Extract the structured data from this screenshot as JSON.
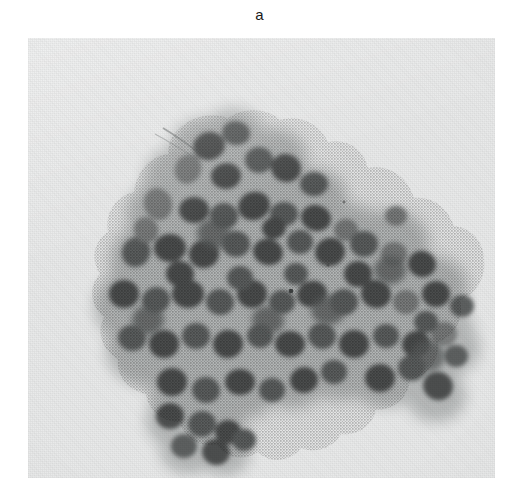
{
  "figure": {
    "panel_label": "a",
    "kind": "light-microscopy-photomicrograph",
    "background_color": "#e9eaea",
    "page_color": "#ffffff",
    "nucleus_color": "#5d6060",
    "nucleus_dark_color": "#4d5050",
    "cytoplasm_color": "#b3b6b6"
  },
  "plate": {
    "left": 28,
    "top": 38,
    "width": 467,
    "height": 440
  },
  "features": {
    "fiber_label": "thin fibrillar strand at upper-left apex",
    "speck_label": "small dark debris speck at right field",
    "cluster_outline_label": "irregular three-dimensional cell cluster"
  }
}
